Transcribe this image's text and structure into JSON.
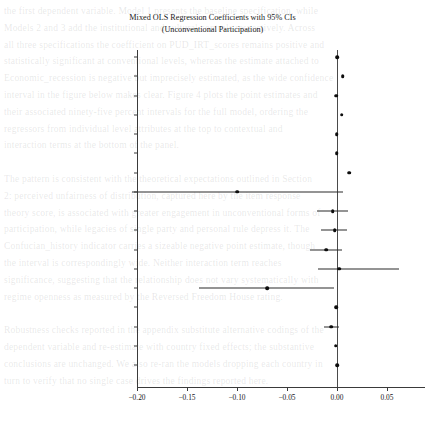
{
  "figure": {
    "title_line1": "Mixed OLS Regression Coefficients with 95% CIs",
    "title_line2": "(Unconventional Participation)"
  },
  "background_text": [
    "the first dependent variable. Model 1 presents the baseline specification, while",
    "Models 2 and 3 add the institutional and cultural controls respectively. Across",
    "all three specifications the coefficient on PUD_IRT_scores remains positive and",
    "statistically significant at conventional levels, whereas the estimate attached to",
    "Economic_recession is negative but imprecisely estimated, as the wide confidence",
    "interval in the figure below makes clear. Figure 4 plots the point estimates and",
    "their associated ninety-five percent intervals for the full model, ordering the",
    "regressors from individual level attributes at the top to contextual and",
    "interaction terms at the bottom of the panel.",
    "",
    "The pattern is consistent with the theoretical expectations outlined in Section",
    "2: perceived unfairness of distribution, captured here by the item response",
    "theory score, is associated with greater engagement in unconventional forms of",
    "participation, while legacies of single party and personal rule depress it. The",
    "Confucian_history indicator carries a sizeable negative point estimate, though",
    "the interval is correspondingly wide. Neither interaction term reaches",
    "significance, suggesting that the relationship does not vary systematically with",
    "regime openness as measured by the Reversed Freedom House rating.",
    "",
    "Robustness checks reported in the appendix substitute alternative codings of the",
    "dependent variable and re-estimate with country fixed effects; the substantive",
    "conclusions are unchanged. We also re-ran the models dropping each country in",
    "turn to verify that no single case drives the findings reported here."
  ],
  "chart_data": {
    "type": "scatter",
    "subtype": "coefficient-plot",
    "title": "Mixed OLS Regression Coefficients with 95% CIs (Unconventional Participation)",
    "xlabel": "",
    "ylabel": "",
    "xlim": [
      -0.205,
      0.062
    ],
    "xticks": [
      -0.2,
      -0.15,
      -0.1,
      -0.05,
      0.0,
      0.05
    ],
    "xticklabels": [
      "−0.20",
      "−0.15",
      "−0.10",
      "−0.05",
      "0.00",
      "0.05"
    ],
    "grid": false,
    "legend": false,
    "reference_line": 0.0,
    "categories": [
      "Age_group",
      "Male",
      "Education",
      "Political_interest",
      "National_economy",
      "Family_economy",
      "PUD_IRT_scores",
      "Economic_recession",
      "Economy_recovery",
      "GDP_per_capita (ln)",
      "Single_party_regime_history",
      "Personal_regime_history",
      "Confucian_history",
      "Democratic_capital",
      "Reversed_FH_Rating",
      "IRT*RFH",
      "Education*RFH"
    ],
    "values": [
      0.0,
      0.0056,
      -0.001,
      0.0045,
      -0.0005,
      -0.0003,
      0.012,
      -0.1,
      -0.0045,
      -0.0025,
      -0.011,
      0.002,
      -0.07,
      -0.0008,
      -0.006,
      -0.0015,
      0.0
    ],
    "ci_lower": [
      -0.001,
      0.0048,
      -0.0022,
      0.0036,
      -0.0014,
      -0.0012,
      0.0105,
      -0.205,
      -0.02,
      -0.016,
      -0.027,
      -0.019,
      -0.138,
      -0.0018,
      -0.0135,
      -0.0025,
      -0.0008
    ],
    "ci_upper": [
      0.001,
      0.0064,
      0.0002,
      0.0054,
      0.0004,
      0.0006,
      0.0135,
      0.0055,
      0.011,
      0.0095,
      0.005,
      0.062,
      -0.0035,
      0.0002,
      0.0015,
      -0.0005,
      0.0008
    ]
  }
}
